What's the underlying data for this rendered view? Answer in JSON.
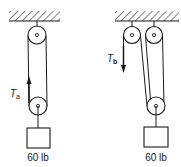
{
  "diagrams": [
    {
      "id": "a",
      "tension_label": "T",
      "tension_subscript": "a",
      "tension_direction": "up",
      "weight_label": "60 lb"
    },
    {
      "id": "b",
      "tension_label": "T",
      "tension_subscript": "b",
      "tension_direction": "down",
      "weight_label": "60 lb"
    }
  ],
  "colors": {
    "ink": "#1a1a1a",
    "background": "#ffffff"
  }
}
